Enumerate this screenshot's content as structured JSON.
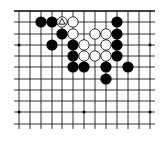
{
  "board": {
    "description": "Go board fragment (top edge visible)",
    "visible_columns": 13,
    "visible_rows": 11,
    "top_edge_is_board_edge": true,
    "col_x": [
      19,
      30,
      41,
      52,
      62,
      73,
      84,
      95,
      106,
      117,
      128,
      139,
      150
    ],
    "row_y": [
      11,
      22,
      34,
      45,
      56,
      67,
      79,
      90,
      101,
      112,
      124
    ],
    "star_points": [
      {
        "col": 1,
        "row": 4
      },
      {
        "col": 13,
        "row": 4
      },
      {
        "col": 1,
        "row": 10
      },
      {
        "col": 7,
        "row": 10
      },
      {
        "col": 13,
        "row": 10
      }
    ],
    "stone_radius": 5.6,
    "colors": {
      "background": "#ffffff",
      "line": "#000000",
      "black_stone": "#000000",
      "white_stone": "#ffffff",
      "white_stone_outline": "#000000"
    },
    "stones": [
      {
        "color": "black",
        "col": 3,
        "row": 2
      },
      {
        "color": "black",
        "col": 4,
        "row": 2
      },
      {
        "color": "white",
        "col": 5,
        "row": 2,
        "marker": "triangle"
      },
      {
        "color": "white",
        "col": 6,
        "row": 2
      },
      {
        "color": "black",
        "col": 10,
        "row": 2
      },
      {
        "color": "black",
        "col": 5,
        "row": 3
      },
      {
        "color": "white",
        "col": 6,
        "row": 3
      },
      {
        "color": "white",
        "col": 8,
        "row": 3
      },
      {
        "color": "white",
        "col": 9,
        "row": 3
      },
      {
        "color": "black",
        "col": 10,
        "row": 3
      },
      {
        "color": "black",
        "col": 4,
        "row": 4
      },
      {
        "color": "black",
        "col": 6,
        "row": 4
      },
      {
        "color": "white",
        "col": 7,
        "row": 4
      },
      {
        "color": "white",
        "col": 9,
        "row": 4
      },
      {
        "color": "black",
        "col": 10,
        "row": 4
      },
      {
        "color": "black",
        "col": 6,
        "row": 5
      },
      {
        "color": "white",
        "col": 7,
        "row": 5
      },
      {
        "color": "white",
        "col": 8,
        "row": 5
      },
      {
        "color": "white",
        "col": 9,
        "row": 5
      },
      {
        "color": "black",
        "col": 10,
        "row": 5
      },
      {
        "color": "black",
        "col": 6,
        "row": 6
      },
      {
        "color": "black",
        "col": 7,
        "row": 6
      },
      {
        "color": "black",
        "col": 9,
        "row": 6
      },
      {
        "color": "black",
        "col": 11,
        "row": 6
      },
      {
        "color": "black",
        "col": 9,
        "row": 7
      }
    ],
    "markers": [
      {
        "type": "triangle",
        "col": 5,
        "row": 2,
        "on": "white"
      }
    ]
  }
}
